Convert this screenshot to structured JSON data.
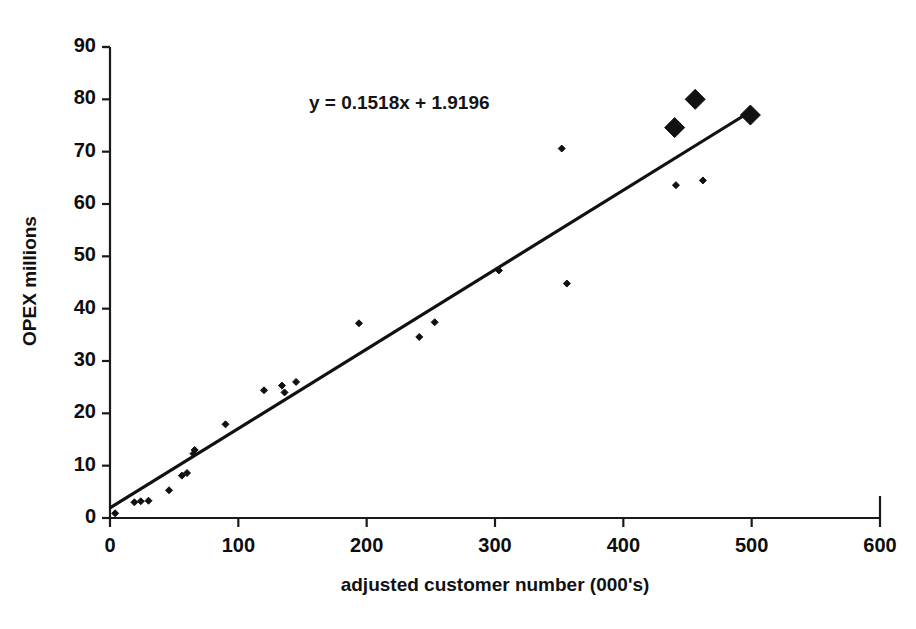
{
  "chart_data": {
    "type": "scatter",
    "title": "",
    "xlabel": "adjusted customer number (000's)",
    "ylabel": "OPEX millions",
    "xlim": [
      0,
      600
    ],
    "ylim": [
      0,
      90
    ],
    "xticks": [
      "0",
      "100",
      "200",
      "300",
      "400",
      "500",
      "600"
    ],
    "yticks": [
      "0",
      "10",
      "20",
      "30",
      "40",
      "50",
      "60",
      "70",
      "80",
      "90"
    ],
    "grid": false,
    "legend": "none",
    "annotations": [
      {
        "name": "trendline-equation",
        "text": "y = 0.1518x + 1.9196",
        "x": 155,
        "y": 79
      }
    ],
    "series": [
      {
        "name": "small-markers",
        "marker": "diamond",
        "marker_size": 7,
        "color": "#111111",
        "points": [
          [
            4,
            0.9
          ],
          [
            19,
            3.0
          ],
          [
            24,
            3.2
          ],
          [
            30,
            3.3
          ],
          [
            46,
            5.3
          ],
          [
            56,
            8.1
          ],
          [
            60,
            8.6
          ],
          [
            65,
            12.3
          ],
          [
            66,
            13.0
          ],
          [
            90,
            17.9
          ],
          [
            120,
            24.4
          ],
          [
            134,
            25.3
          ],
          [
            136,
            24.0
          ],
          [
            145,
            26.0
          ],
          [
            194,
            37.2
          ],
          [
            241,
            34.6
          ],
          [
            253,
            37.4
          ],
          [
            303,
            47.3
          ],
          [
            352,
            70.6
          ],
          [
            356,
            44.8
          ],
          [
            441,
            63.6
          ],
          [
            462,
            64.5
          ]
        ]
      },
      {
        "name": "large-markers",
        "marker": "diamond",
        "marker_size": 20,
        "color": "#111111",
        "points": [
          [
            440,
            74.6
          ],
          [
            456,
            80.0
          ],
          [
            499,
            77.0
          ]
        ]
      }
    ],
    "trendline": {
      "name": "linear-fit-line",
      "slope": 0.1518,
      "intercept": 1.9196,
      "x_start": 0,
      "x_end": 500,
      "color": "#111111",
      "width": 3.2
    }
  },
  "axes": {
    "x_axis_name": "x-axis",
    "y_axis_name": "y-axis"
  }
}
